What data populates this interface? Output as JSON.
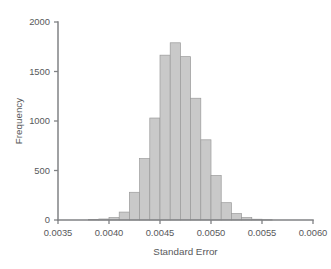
{
  "chart_data": {
    "type": "bar",
    "title": "",
    "subtitle": "",
    "xlabel": "Standard Error",
    "ylabel": "Frequency",
    "xlim": [
      0.0035,
      0.006
    ],
    "ylim": [
      0,
      2000
    ],
    "grid": false,
    "legend": false,
    "legend_position": "none",
    "bin_width": 0.0001,
    "xticks": [
      0.0035,
      0.004,
      0.0045,
      0.005,
      0.0055,
      0.006
    ],
    "xtick_labels": [
      "0.0035",
      "0.0040",
      "0.0045",
      "0.0050",
      "0.0055",
      "0.0060"
    ],
    "yticks": [
      0,
      500,
      1000,
      1500,
      2000
    ],
    "ytick_labels": [
      "0",
      "500",
      "1000",
      "1500",
      "2000"
    ],
    "bin_edges": [
      0.0038,
      0.0039,
      0.004,
      0.0041,
      0.0042,
      0.0043,
      0.0044,
      0.0045,
      0.0046,
      0.0047,
      0.0048,
      0.0049,
      0.005,
      0.0051,
      0.0052,
      0.0053,
      0.0054,
      0.0055,
      0.0056
    ],
    "bin_centers": [
      0.00385,
      0.00395,
      0.00405,
      0.00415,
      0.00425,
      0.00435,
      0.00445,
      0.00455,
      0.00465,
      0.00475,
      0.00485,
      0.00495,
      0.00505,
      0.00515,
      0.00525,
      0.00535,
      0.00545,
      0.00555
    ],
    "values": [
      5,
      10,
      25,
      80,
      280,
      620,
      1030,
      1665,
      1790,
      1650,
      1230,
      810,
      450,
      175,
      65,
      25,
      8,
      3
    ],
    "peak_value": 1790,
    "peak_center": 0.00475,
    "colors": {
      "bar_fill": "#c9c9c9",
      "bar_edge": "#9a9a9a",
      "axis": "#808285",
      "text": "#58595b",
      "background": "#ffffff"
    }
  },
  "figure": {
    "plot_left": 58,
    "plot_right": 313,
    "plot_top": 22,
    "plot_bottom": 220
  }
}
